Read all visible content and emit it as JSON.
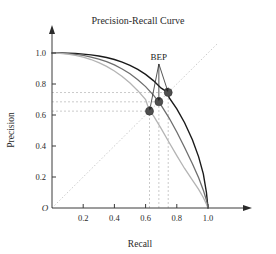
{
  "chart_data": {
    "type": "line",
    "title": "Precision-Recall Curve",
    "xlabel": "Recall",
    "ylabel": "Precision",
    "xlim": [
      0,
      1.08
    ],
    "ylim": [
      0,
      1.08
    ],
    "xticks": [
      "0.2",
      "0.4",
      "0.6",
      "0.8",
      "1.0"
    ],
    "xtick_values": [
      0.2,
      0.4,
      0.6,
      0.8,
      1.0
    ],
    "yticks": [
      "0.2",
      "0.4",
      "0.6",
      "0.8",
      "1.0"
    ],
    "ytick_values": [
      0.2,
      0.4,
      0.6,
      0.8,
      1.0
    ],
    "origin_label": "O",
    "grid": false,
    "legend": "none",
    "annotations": [
      {
        "text": "BEP",
        "x": 0.685,
        "y": 0.955,
        "description": "Break-Even Point label with three leader arrows pointing to the three BEP markers"
      }
    ],
    "diagonal_reference_line": {
      "name": "precision-equals-recall",
      "from": [
        0,
        0
      ],
      "to": [
        1.06,
        1.06
      ],
      "style": "dotted",
      "color": "#cccccc"
    },
    "series": [
      {
        "name": "Learner A",
        "color": "#1a1a1a",
        "width": 1.4,
        "points": [
          [
            0.0,
            1.0
          ],
          [
            0.05,
            1.0
          ],
          [
            0.1,
            0.999
          ],
          [
            0.15,
            0.997
          ],
          [
            0.2,
            0.993
          ],
          [
            0.25,
            0.988
          ],
          [
            0.3,
            0.981
          ],
          [
            0.35,
            0.971
          ],
          [
            0.4,
            0.958
          ],
          [
            0.45,
            0.941
          ],
          [
            0.5,
            0.92
          ],
          [
            0.55,
            0.894
          ],
          [
            0.6,
            0.862
          ],
          [
            0.65,
            0.822
          ],
          [
            0.7,
            0.773
          ],
          [
            0.745,
            0.745
          ],
          [
            0.75,
            0.713
          ],
          [
            0.8,
            0.64
          ],
          [
            0.85,
            0.55
          ],
          [
            0.9,
            0.44
          ],
          [
            0.94,
            0.33
          ],
          [
            0.97,
            0.22
          ],
          [
            0.99,
            0.1
          ],
          [
            1.0,
            0.0
          ]
        ]
      },
      {
        "name": "Learner B",
        "color": "#6e6e6e",
        "width": 1.3,
        "points": [
          [
            0.0,
            1.0
          ],
          [
            0.05,
            0.999
          ],
          [
            0.1,
            0.996
          ],
          [
            0.15,
            0.991
          ],
          [
            0.2,
            0.984
          ],
          [
            0.25,
            0.974
          ],
          [
            0.3,
            0.961
          ],
          [
            0.35,
            0.944
          ],
          [
            0.4,
            0.923
          ],
          [
            0.45,
            0.897
          ],
          [
            0.5,
            0.866
          ],
          [
            0.55,
            0.828
          ],
          [
            0.6,
            0.783
          ],
          [
            0.65,
            0.728
          ],
          [
            0.685,
            0.685
          ],
          [
            0.7,
            0.662
          ],
          [
            0.75,
            0.582
          ],
          [
            0.8,
            0.49
          ],
          [
            0.85,
            0.39
          ],
          [
            0.9,
            0.285
          ],
          [
            0.94,
            0.195
          ],
          [
            0.97,
            0.115
          ],
          [
            0.99,
            0.05
          ],
          [
            1.0,
            0.0
          ]
        ]
      },
      {
        "name": "Learner C",
        "color": "#b4b4b4",
        "width": 1.3,
        "points": [
          [
            0.0,
            1.0
          ],
          [
            0.05,
            0.998
          ],
          [
            0.1,
            0.993
          ],
          [
            0.15,
            0.985
          ],
          [
            0.2,
            0.973
          ],
          [
            0.25,
            0.958
          ],
          [
            0.3,
            0.938
          ],
          [
            0.35,
            0.914
          ],
          [
            0.4,
            0.884
          ],
          [
            0.45,
            0.848
          ],
          [
            0.5,
            0.806
          ],
          [
            0.55,
            0.757
          ],
          [
            0.6,
            0.7
          ],
          [
            0.625,
            0.625
          ],
          [
            0.65,
            0.596
          ],
          [
            0.7,
            0.512
          ],
          [
            0.75,
            0.424
          ],
          [
            0.8,
            0.338
          ],
          [
            0.85,
            0.255
          ],
          [
            0.9,
            0.18
          ],
          [
            0.94,
            0.12
          ],
          [
            0.97,
            0.068
          ],
          [
            0.99,
            0.025
          ],
          [
            1.0,
            0.0
          ]
        ]
      }
    ],
    "markers": [
      {
        "name": "bep-point-c",
        "x": 0.625,
        "y": 0.625,
        "color": "#4f4f4f",
        "radius": 4.0,
        "series": "Learner C"
      },
      {
        "name": "bep-point-b",
        "x": 0.685,
        "y": 0.685,
        "color": "#4f4f4f",
        "radius": 4.0,
        "series": "Learner B"
      },
      {
        "name": "bep-point-a",
        "x": 0.745,
        "y": 0.745,
        "color": "#4f4f4f",
        "radius": 4.0,
        "series": "Learner A"
      }
    ],
    "guide_lines": {
      "style": "dashed",
      "color": "#bdbdbd",
      "horizontal_values": [
        0.625,
        0.685,
        0.745
      ],
      "vertical_values": [
        0.625,
        0.685,
        0.745
      ]
    }
  }
}
